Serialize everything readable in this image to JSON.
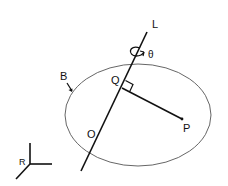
{
  "diagram": {
    "labels": {
      "axis_line": "L",
      "rotation_angle": "θ",
      "body": "B",
      "foot_point": "Q",
      "point": "P",
      "origin": "O",
      "reference_frame": "R"
    },
    "colors": {
      "stroke": "#111111",
      "ellipse_stroke": "#555555",
      "background": "#ffffff"
    }
  }
}
